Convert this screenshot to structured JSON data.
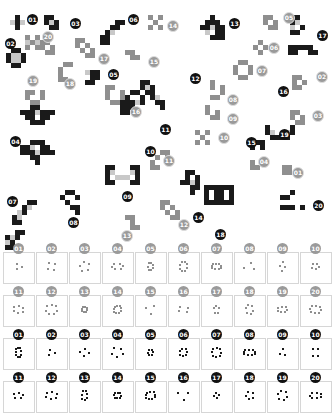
{
  "scatter": {
    "labels": [
      {
        "text": "01",
        "style": "b",
        "x": 27,
        "y": 14
      },
      {
        "text": "02",
        "style": "b",
        "x": 5,
        "y": 38
      },
      {
        "text": "03",
        "style": "b",
        "x": 70,
        "y": 18
      },
      {
        "text": "04",
        "style": "b",
        "x": 10,
        "y": 136
      },
      {
        "text": "05",
        "style": "b",
        "x": 108,
        "y": 69
      },
      {
        "text": "06",
        "style": "b",
        "x": 128,
        "y": 14
      },
      {
        "text": "07",
        "style": "b",
        "x": 7,
        "y": 196
      },
      {
        "text": "08",
        "style": "b",
        "x": 68,
        "y": 217
      },
      {
        "text": "09",
        "style": "b",
        "x": 122,
        "y": 191
      },
      {
        "text": "10",
        "style": "b",
        "x": 145,
        "y": 146
      },
      {
        "text": "11",
        "style": "b",
        "x": 160,
        "y": 124
      },
      {
        "text": "12",
        "style": "b",
        "x": 190,
        "y": 73
      },
      {
        "text": "13",
        "style": "b",
        "x": 229,
        "y": 18
      },
      {
        "text": "14",
        "style": "b",
        "x": 193,
        "y": 212
      },
      {
        "text": "15",
        "style": "b",
        "x": 246,
        "y": 137
      },
      {
        "text": "16",
        "style": "b",
        "x": 278,
        "y": 86
      },
      {
        "text": "17",
        "style": "b",
        "x": 317,
        "y": 30
      },
      {
        "text": "18",
        "style": "b",
        "x": 215,
        "y": 229
      },
      {
        "text": "19",
        "style": "b",
        "x": 279,
        "y": 129
      },
      {
        "text": "20",
        "style": "b",
        "x": 313,
        "y": 200
      },
      {
        "text": "01",
        "style": "g",
        "x": 292,
        "y": 167
      },
      {
        "text": "02",
        "style": "g",
        "x": 316,
        "y": 71
      },
      {
        "text": "03",
        "style": "g",
        "x": 312,
        "y": 110
      },
      {
        "text": "04",
        "style": "g",
        "x": 258,
        "y": 156
      },
      {
        "text": "05",
        "style": "g",
        "x": 283,
        "y": 12
      },
      {
        "text": "06",
        "style": "g",
        "x": 268,
        "y": 42
      },
      {
        "text": "07",
        "style": "g",
        "x": 256,
        "y": 65
      },
      {
        "text": "08",
        "style": "g",
        "x": 227,
        "y": 94
      },
      {
        "text": "09",
        "style": "g",
        "x": 227,
        "y": 113
      },
      {
        "text": "10",
        "style": "g",
        "x": 218,
        "y": 132
      },
      {
        "text": "11",
        "style": "g",
        "x": 163,
        "y": 155
      },
      {
        "text": "12",
        "style": "g",
        "x": 178,
        "y": 219
      },
      {
        "text": "13",
        "style": "g",
        "x": 121,
        "y": 230
      },
      {
        "text": "14",
        "style": "g",
        "x": 167,
        "y": 20
      },
      {
        "text": "15",
        "style": "g",
        "x": 148,
        "y": 56
      },
      {
        "text": "16",
        "style": "g",
        "x": 130,
        "y": 106
      },
      {
        "text": "17",
        "style": "g",
        "x": 98,
        "y": 53
      },
      {
        "text": "18",
        "style": "g",
        "x": 64,
        "y": 78
      },
      {
        "text": "19",
        "style": "g",
        "x": 27,
        "y": 75
      },
      {
        "text": "20",
        "style": "g",
        "x": 42,
        "y": 31
      }
    ]
  },
  "grid": {
    "rows": [
      {
        "style": "g",
        "labels": [
          "01",
          "02",
          "03",
          "04",
          "05",
          "06",
          "07",
          "08",
          "09",
          "10"
        ]
      },
      {
        "style": "g",
        "labels": [
          "11",
          "12",
          "13",
          "14",
          "15",
          "16",
          "17",
          "18",
          "19",
          "20"
        ]
      },
      {
        "style": "b",
        "labels": [
          "01",
          "02",
          "03",
          "04",
          "05",
          "06",
          "07",
          "08",
          "09",
          "10"
        ]
      },
      {
        "style": "b",
        "labels": [
          "11",
          "12",
          "13",
          "14",
          "15",
          "16",
          "17",
          "18",
          "19",
          "20"
        ]
      }
    ]
  },
  "colors": {
    "black": "#1a1a1a",
    "gray": "#8f8f8f",
    "light": "#c8c8c8",
    "border": "#d6d6d6"
  }
}
